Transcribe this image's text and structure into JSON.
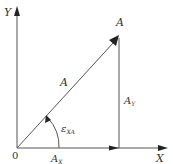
{
  "diagram": {
    "type": "vector-decomposition",
    "colors": {
      "line": "#555555",
      "arrow": "#222222",
      "text": "#333333",
      "background": "#ffffff"
    },
    "axes": {
      "x_label": "X",
      "y_label": "Y",
      "origin_label": "0"
    },
    "vector": {
      "tip_label": "A",
      "magnitude_label": "A"
    },
    "components": {
      "x_component": {
        "base": "A",
        "subscript": "X"
      },
      "y_component": {
        "base": "A",
        "subscript": "Y"
      }
    },
    "angle": {
      "symbol": "ε",
      "subscript": "XA"
    }
  }
}
